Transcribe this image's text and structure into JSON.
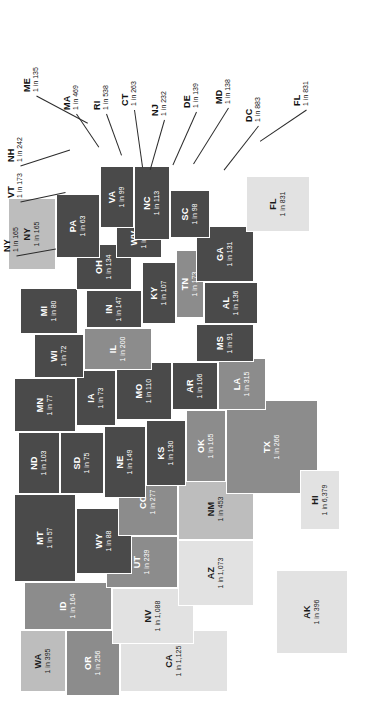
{
  "figure": {
    "orientation": "rotated-90-ccw",
    "background": "#ffffff",
    "label_format": "1 in N"
  },
  "palette": {
    "darkest": "#4a4a4a",
    "dark": "#5e5e5e",
    "medium": "#8c8c8c",
    "light": "#bdbdbd",
    "lightest": "#e2e2e2",
    "border": "#ffffff",
    "leader_line": "#2b2b2b",
    "dark_text": "#1a1a1a",
    "light_text": "#ffffff"
  },
  "chart_data": {
    "type": "map",
    "title": "",
    "subtitle": "",
    "xlabel": "",
    "ylabel": "",
    "value_label_format": "1 in {n}",
    "legend": [],
    "categories": [
      "MT",
      "WY",
      "ND",
      "SD",
      "NE",
      "KS",
      "MN",
      "IA",
      "MO",
      "WI",
      "IL",
      "MI",
      "IN",
      "OH",
      "KY",
      "TN",
      "WV",
      "VA",
      "NC",
      "SC",
      "GA",
      "AL",
      "MS",
      "AR",
      "LA",
      "OK",
      "TX",
      "NM",
      "AZ",
      "CO",
      "UT",
      "NV",
      "ID",
      "WA",
      "OR",
      "CA",
      "AK",
      "HI",
      "ME",
      "NH",
      "VT",
      "NY",
      "PA",
      "NJ",
      "CT",
      "RI",
      "MA",
      "DE",
      "MD",
      "DC",
      "FL"
    ],
    "values": [
      57,
      88,
      103,
      75,
      149,
      130,
      77,
      73,
      110,
      72,
      200,
      80,
      147,
      134,
      107,
      173,
      46,
      99,
      113,
      98,
      131,
      136,
      91,
      106,
      315,
      165,
      266,
      453,
      1073,
      277,
      239,
      1088,
      164,
      395,
      256,
      1125,
      396,
      6379,
      135,
      242,
      173,
      165,
      63,
      232,
      263,
      538,
      469,
      139,
      138,
      883,
      831
    ],
    "states": [
      {
        "code": "MT",
        "rate": "1 in 57",
        "value": 57,
        "shade": "darkest",
        "text": "light"
      },
      {
        "code": "WY",
        "rate": "1 in 88",
        "value": 88,
        "shade": "darkest",
        "text": "light"
      },
      {
        "code": "ND",
        "rate": "1 in 103",
        "value": 103,
        "shade": "darkest",
        "text": "light"
      },
      {
        "code": "SD",
        "rate": "1 in 75",
        "value": 75,
        "shade": "darkest",
        "text": "light"
      },
      {
        "code": "NE",
        "rate": "1 in 149",
        "value": 149,
        "shade": "darkest",
        "text": "light"
      },
      {
        "code": "KS",
        "rate": "1 in 130",
        "value": 130,
        "shade": "darkest",
        "text": "light"
      },
      {
        "code": "MN",
        "rate": "1 in 77",
        "value": 77,
        "shade": "darkest",
        "text": "light"
      },
      {
        "code": "IA",
        "rate": "1 in 73",
        "value": 73,
        "shade": "darkest",
        "text": "light"
      },
      {
        "code": "MO",
        "rate": "1 in 110",
        "value": 110,
        "shade": "darkest",
        "text": "light"
      },
      {
        "code": "WI",
        "rate": "1 in 72",
        "value": 72,
        "shade": "darkest",
        "text": "light"
      },
      {
        "code": "IL",
        "rate": "1 in 200",
        "value": 200,
        "shade": "medium",
        "text": "light"
      },
      {
        "code": "MI",
        "rate": "1 in 80",
        "value": 80,
        "shade": "darkest",
        "text": "light"
      },
      {
        "code": "IN",
        "rate": "1 in 147",
        "value": 147,
        "shade": "darkest",
        "text": "light"
      },
      {
        "code": "OH",
        "rate": "1 in 134",
        "value": 134,
        "shade": "darkest",
        "text": "light"
      },
      {
        "code": "KY",
        "rate": "1 in 107",
        "value": 107,
        "shade": "darkest",
        "text": "light"
      },
      {
        "code": "TN",
        "rate": "1 in 173",
        "value": 173,
        "shade": "medium",
        "text": "light"
      },
      {
        "code": "WV",
        "rate": "1 in 46",
        "value": 46,
        "shade": "darkest",
        "text": "light"
      },
      {
        "code": "VA",
        "rate": "1 in 99",
        "value": 99,
        "shade": "darkest",
        "text": "light"
      },
      {
        "code": "NC",
        "rate": "1 in 113",
        "value": 113,
        "shade": "darkest",
        "text": "light"
      },
      {
        "code": "SC",
        "rate": "1 in 98",
        "value": 98,
        "shade": "darkest",
        "text": "light"
      },
      {
        "code": "GA",
        "rate": "1 in 131",
        "value": 131,
        "shade": "darkest",
        "text": "light"
      },
      {
        "code": "AL",
        "rate": "1 in 136",
        "value": 136,
        "shade": "darkest",
        "text": "light"
      },
      {
        "code": "MS",
        "rate": "1 in 91",
        "value": 91,
        "shade": "darkest",
        "text": "light"
      },
      {
        "code": "AR",
        "rate": "1 in 106",
        "value": 106,
        "shade": "darkest",
        "text": "light"
      },
      {
        "code": "LA",
        "rate": "1 in 315",
        "value": 315,
        "shade": "medium",
        "text": "light"
      },
      {
        "code": "OK",
        "rate": "1 in 165",
        "value": 165,
        "shade": "medium",
        "text": "light"
      },
      {
        "code": "TX",
        "rate": "1 in 266",
        "value": 266,
        "shade": "medium",
        "text": "light"
      },
      {
        "code": "NM",
        "rate": "1 in 453",
        "value": 453,
        "shade": "light",
        "text": "dark"
      },
      {
        "code": "AZ",
        "rate": "1 in 1,073",
        "value": 1073,
        "shade": "lightest",
        "text": "dark"
      },
      {
        "code": "CO",
        "rate": "1 in 277",
        "value": 277,
        "shade": "medium",
        "text": "light"
      },
      {
        "code": "UT",
        "rate": "1 in 239",
        "value": 239,
        "shade": "medium",
        "text": "light"
      },
      {
        "code": "NV",
        "rate": "1 in 1,088",
        "value": 1088,
        "shade": "lightest",
        "text": "dark"
      },
      {
        "code": "ID",
        "rate": "1 in 164",
        "value": 164,
        "shade": "medium",
        "text": "light"
      },
      {
        "code": "WA",
        "rate": "1 in 395",
        "value": 395,
        "shade": "light",
        "text": "dark"
      },
      {
        "code": "OR",
        "rate": "1 in 256",
        "value": 256,
        "shade": "medium",
        "text": "light"
      },
      {
        "code": "CA",
        "rate": "1 in 1,125",
        "value": 1125,
        "shade": "lightest",
        "text": "dark"
      },
      {
        "code": "AK",
        "rate": "1 in 396",
        "value": 396,
        "shade": "lightest",
        "text": "dark"
      },
      {
        "code": "HI",
        "rate": "1 in 6,379",
        "value": 6379,
        "shade": "lightest",
        "text": "dark"
      },
      {
        "code": "PA",
        "rate": "1 in 63",
        "value": 63,
        "shade": "darkest",
        "text": "light"
      },
      {
        "code": "NY",
        "rate": "1 in 165",
        "value": 165,
        "shade": "light",
        "text": "dark"
      },
      {
        "code": "FL",
        "rate": "1 in 831",
        "value": 831,
        "shade": "lightest",
        "text": "dark"
      }
    ],
    "callouts": [
      {
        "code": "ME",
        "rate": "1 in 135",
        "value": 135
      },
      {
        "code": "MA",
        "rate": "1 in 469",
        "value": 469
      },
      {
        "code": "RI",
        "rate": "1 in 538",
        "value": 538
      },
      {
        "code": "CT",
        "rate": "1 in 263",
        "value": 263
      },
      {
        "code": "NH",
        "rate": "1 in 242",
        "value": 242
      },
      {
        "code": "VT",
        "rate": "1 in 173",
        "value": 173
      },
      {
        "code": "NY",
        "rate": "1 in 165",
        "value": 165
      },
      {
        "code": "NJ",
        "rate": "1 in 232",
        "value": 232
      },
      {
        "code": "DE",
        "rate": "1 in 139",
        "value": 139
      },
      {
        "code": "MD",
        "rate": "1 in 138",
        "value": 138
      },
      {
        "code": "DC",
        "rate": "1 in 883",
        "value": 883
      },
      {
        "code": "FL",
        "rate": "1 in 831",
        "value": 831
      }
    ]
  },
  "map": {
    "states": [
      {
        "code": "WA",
        "rate": "1 in 395",
        "shade": "light",
        "text": "dark",
        "x": 18,
        "y": 20,
        "w": 62,
        "h": 46
      },
      {
        "code": "OR",
        "rate": "1 in 256",
        "shade": "medium",
        "text": "light",
        "x": 14,
        "y": 66,
        "w": 66,
        "h": 54
      },
      {
        "code": "CA",
        "rate": "1 in 1,125",
        "shade": "lightest",
        "text": "dark",
        "x": 18,
        "y": 120,
        "w": 62,
        "h": 108
      },
      {
        "code": "ID",
        "rate": "1 in 164",
        "shade": "medium",
        "text": "light",
        "x": 80,
        "y": 24,
        "w": 48,
        "h": 88
      },
      {
        "code": "NV",
        "rate": "1 in 1,088",
        "shade": "lightest",
        "text": "dark",
        "x": 66,
        "y": 112,
        "w": 56,
        "h": 82
      },
      {
        "code": "UT",
        "rate": "1 in 239",
        "shade": "medium",
        "text": "light",
        "x": 122,
        "y": 106,
        "w": 52,
        "h": 72
      },
      {
        "code": "AZ",
        "rate": "1 in 1,073",
        "shade": "lightest",
        "text": "dark",
        "x": 104,
        "y": 178,
        "w": 66,
        "h": 76
      },
      {
        "code": "MT",
        "rate": "1 in 57",
        "shade": "darkest",
        "text": "light",
        "x": 128,
        "y": 14,
        "w": 88,
        "h": 62
      },
      {
        "code": "WY",
        "rate": "1 in 88",
        "shade": "darkest",
        "text": "light",
        "x": 136,
        "y": 76,
        "w": 66,
        "h": 56
      },
      {
        "code": "CO",
        "rate": "1 in 277",
        "shade": "medium",
        "text": "light",
        "x": 174,
        "y": 118,
        "w": 68,
        "h": 60
      },
      {
        "code": "NM",
        "rate": "1 in 453",
        "shade": "light",
        "text": "dark",
        "x": 170,
        "y": 178,
        "w": 62,
        "h": 76
      },
      {
        "code": "ND",
        "rate": "1 in 103",
        "shade": "darkest",
        "text": "light",
        "x": 216,
        "y": 18,
        "w": 62,
        "h": 42
      },
      {
        "code": "SD",
        "rate": "1 in 75",
        "shade": "darkest",
        "text": "light",
        "x": 216,
        "y": 60,
        "w": 62,
        "h": 44
      },
      {
        "code": "NE",
        "rate": "1 in 149",
        "shade": "darkest",
        "text": "light",
        "x": 212,
        "y": 104,
        "w": 72,
        "h": 42
      },
      {
        "code": "KS",
        "rate": "1 in 130",
        "shade": "darkest",
        "text": "light",
        "x": 224,
        "y": 146,
        "w": 66,
        "h": 40
      },
      {
        "code": "OK",
        "rate": "1 in 165",
        "shade": "medium",
        "text": "light",
        "x": 228,
        "y": 186,
        "w": 72,
        "h": 40
      },
      {
        "code": "TX",
        "rate": "1 in 266",
        "shade": "medium",
        "text": "light",
        "x": 216,
        "y": 226,
        "w": 94,
        "h": 92
      },
      {
        "code": "MN",
        "rate": "1 in 77",
        "shade": "darkest",
        "text": "light",
        "x": 278,
        "y": 14,
        "w": 54,
        "h": 62
      },
      {
        "code": "IA",
        "rate": "1 in 73",
        "shade": "darkest",
        "text": "light",
        "x": 284,
        "y": 76,
        "w": 56,
        "h": 40
      },
      {
        "code": "MO",
        "rate": "1 in 110",
        "shade": "darkest",
        "text": "light",
        "x": 290,
        "y": 116,
        "w": 58,
        "h": 56
      },
      {
        "code": "AR",
        "rate": "1 in 106",
        "shade": "darkest",
        "text": "light",
        "x": 300,
        "y": 172,
        "w": 48,
        "h": 46
      },
      {
        "code": "LA",
        "rate": "1 in 315",
        "shade": "medium",
        "text": "light",
        "x": 300,
        "y": 218,
        "w": 52,
        "h": 48
      },
      {
        "code": "WI",
        "rate": "1 in 72",
        "shade": "darkest",
        "text": "light",
        "x": 332,
        "y": 34,
        "w": 44,
        "h": 50
      },
      {
        "code": "IL",
        "rate": "1 in 200",
        "shade": "medium",
        "text": "light",
        "x": 340,
        "y": 84,
        "w": 42,
        "h": 68
      },
      {
        "code": "MS",
        "rate": "1 in 91",
        "shade": "darkest",
        "text": "light",
        "x": 348,
        "y": 196,
        "w": 38,
        "h": 58
      },
      {
        "code": "MI",
        "rate": "1 in 80",
        "shade": "darkest",
        "text": "light",
        "x": 376,
        "y": 20,
        "w": 46,
        "h": 58
      },
      {
        "code": "IN",
        "rate": "1 in 147",
        "shade": "darkest",
        "text": "light",
        "x": 382,
        "y": 86,
        "w": 38,
        "h": 56
      },
      {
        "code": "KY",
        "rate": "1 in 107",
        "shade": "darkest",
        "text": "light",
        "x": 386,
        "y": 142,
        "w": 62,
        "h": 34
      },
      {
        "code": "TN",
        "rate": "1 in 173",
        "shade": "medium",
        "text": "light",
        "x": 392,
        "y": 176,
        "w": 68,
        "h": 28
      },
      {
        "code": "AL",
        "rate": "1 in 136",
        "shade": "darkest",
        "text": "light",
        "x": 386,
        "y": 204,
        "w": 42,
        "h": 54
      },
      {
        "code": "OH",
        "rate": "1 in 134",
        "shade": "darkest",
        "text": "light",
        "x": 420,
        "y": 76,
        "w": 46,
        "h": 56
      },
      {
        "code": "WV",
        "rate": "1 in 46",
        "shade": "darkest",
        "text": "light",
        "x": 452,
        "y": 116,
        "w": 40,
        "h": 46
      },
      {
        "code": "GA",
        "rate": "1 in 131",
        "shade": "darkest",
        "text": "light",
        "x": 428,
        "y": 196,
        "w": 56,
        "h": 58
      },
      {
        "code": "SC",
        "rate": "1 in 98",
        "shade": "darkest",
        "text": "light",
        "x": 472,
        "y": 170,
        "w": 48,
        "h": 40
      },
      {
        "code": "NC",
        "rate": "1 in 113",
        "shade": "darkest",
        "text": "light",
        "x": 470,
        "y": 134,
        "w": 74,
        "h": 36
      },
      {
        "code": "VA",
        "rate": "1 in 99",
        "shade": "darkest",
        "text": "light",
        "x": 482,
        "y": 100,
        "w": 62,
        "h": 34
      },
      {
        "code": "PA",
        "rate": "1 in 63",
        "shade": "darkest",
        "text": "light",
        "x": 452,
        "y": 56,
        "w": 64,
        "h": 44
      },
      {
        "code": "NY",
        "rate": "1 in 165",
        "shade": "light",
        "text": "dark",
        "x": 440,
        "y": 8,
        "w": 72,
        "h": 48
      },
      {
        "code": "FL",
        "rate": "1 in 831",
        "shade": "lightest",
        "text": "dark",
        "x": 478,
        "y": 246,
        "w": 56,
        "h": 64
      },
      {
        "code": "AK",
        "rate": "1 in 396",
        "shade": "lightest",
        "text": "dark",
        "x": 56,
        "y": 276,
        "w": 84,
        "h": 72
      },
      {
        "code": "HI",
        "rate": "1 in 6,379",
        "shade": "lightest",
        "text": "dark",
        "x": 180,
        "y": 300,
        "w": 60,
        "h": 40
      }
    ],
    "callouts": [
      {
        "code": "ME",
        "rate": "1 in 135",
        "x": 618,
        "y": 22,
        "len": 58,
        "angle": 118
      },
      {
        "code": "NH",
        "rate": "1 in 242",
        "x": 548,
        "y": 6,
        "len": 52,
        "angle": 72
      },
      {
        "code": "VT",
        "rate": "1 in 173",
        "x": 512,
        "y": 6,
        "len": 46,
        "angle": 78
      },
      {
        "code": "NY",
        "rate": "1 in 165",
        "x": 458,
        "y": 2,
        "len": 40,
        "angle": 80
      },
      {
        "code": "MA",
        "rate": "1 in 469",
        "x": 600,
        "y": 62,
        "len": 40,
        "angle": 146
      },
      {
        "code": "RI",
        "rate": "1 in 538",
        "x": 600,
        "y": 92,
        "len": 44,
        "angle": 160
      },
      {
        "code": "CT",
        "rate": "1 in 263",
        "x": 604,
        "y": 120,
        "len": 58,
        "angle": 172
      },
      {
        "code": "NJ",
        "rate": "1 in 232",
        "x": 594,
        "y": 150,
        "len": 52,
        "angle": 196
      },
      {
        "code": "DE",
        "rate": "1 in 139",
        "x": 602,
        "y": 182,
        "len": 58,
        "angle": 204
      },
      {
        "code": "MD",
        "rate": "1 in 138",
        "x": 606,
        "y": 214,
        "len": 66,
        "angle": 212
      },
      {
        "code": "DC",
        "rate": "1 in 883",
        "x": 588,
        "y": 244,
        "len": 56,
        "angle": 218
      },
      {
        "code": "FL",
        "rate": "1 in 831",
        "x": 604,
        "y": 292,
        "len": 56,
        "angle": 236
      }
    ]
  }
}
